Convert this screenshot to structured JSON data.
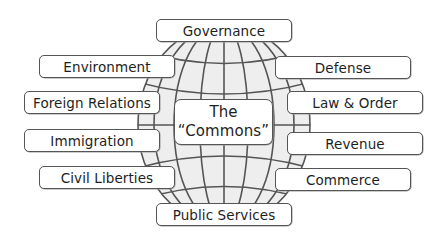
{
  "diagram": {
    "center": {
      "line1": "The",
      "line2": "“Commons”"
    },
    "top": {
      "label": "Governance"
    },
    "bottom": {
      "label": "Public Services"
    },
    "left": [
      {
        "label": "Environment"
      },
      {
        "label": "Foreign Relations"
      },
      {
        "label": "Immigration"
      },
      {
        "label": "Civil Liberties"
      }
    ],
    "right": [
      {
        "label": "Defense"
      },
      {
        "label": "Law & Order"
      },
      {
        "label": "Revenue"
      },
      {
        "label": "Commerce"
      }
    ],
    "globe_icon": "globe-grid-icon",
    "colors": {
      "globe_fill": "#eeeeee",
      "grid_lines": "#555555",
      "box_border": "#555555",
      "text": "#1e1e1e"
    }
  }
}
